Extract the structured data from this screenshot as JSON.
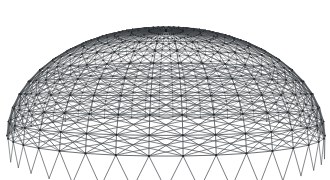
{
  "scene": {
    "title": "Geodesic space-frame dome",
    "subject": "dome-lattice",
    "background_color": "#ffffff",
    "width": 330,
    "height": 180
  },
  "structure": {
    "name": "Triangulated spherical-cap space frame",
    "type": "geodesic-dome-lattice",
    "member_color": "#555a5e",
    "member_color_far": "#2e3134",
    "node_color": "#1f2224",
    "node_radius_near": 1.15,
    "node_radius_far": 0.45,
    "member_width_near": 0.95,
    "member_width_far": 0.38,
    "ring_count": 13,
    "sector_count": 46,
    "has_ring_members": true,
    "has_radial_members": true,
    "has_diagonal_bracing": true,
    "has_nodes": true
  },
  "geometry": {
    "center_x": 166,
    "center_y": 128,
    "radius_x": 144,
    "radius_y": 52,
    "cap_height": 106,
    "apex_y": 22,
    "rim_front_y": 180,
    "rim_left_x": 22,
    "rim_right_x": 310,
    "eye_height": 0.34,
    "perspective": 2.35,
    "flatten": 0.36
  },
  "chart_data": {
    "type": "scatter",
    "xlabel": "",
    "ylabel": "",
    "categories": [],
    "values": []
  }
}
